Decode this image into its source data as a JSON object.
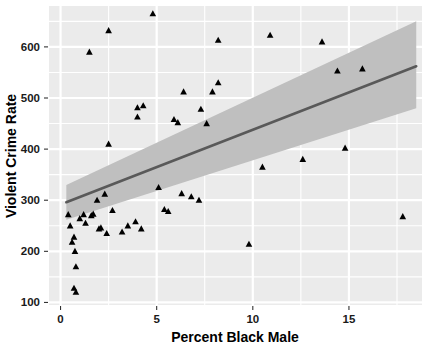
{
  "chart_data": {
    "type": "scatter",
    "title": "",
    "xlabel": "Percent Black Male",
    "ylabel": "Violent Crime Rate",
    "xlim": [
      -0.6,
      18.8
    ],
    "ylim": [
      95,
      680
    ],
    "xticks": [
      0,
      5,
      10,
      15
    ],
    "xtick_labels": [
      "0",
      "5",
      "10",
      "15"
    ],
    "yticks": [
      100,
      200,
      300,
      400,
      500,
      600
    ],
    "ytick_labels": [
      "100",
      "200",
      "300",
      "400",
      "500",
      "600"
    ],
    "grid": true,
    "legend": "none",
    "panel_background": "#EBEBEB",
    "grid_color": "#FFFFFF",
    "point_color": "#000000",
    "point_shape": "triangle",
    "line_color": "#595959",
    "band_color": "#BFBFBF",
    "fit": {
      "type": "linear",
      "intercept": 292,
      "slope": 14.6,
      "x_start": 0.3,
      "x_end": 18.5,
      "y_start": 296,
      "y_end": 562,
      "band_lower_start": 262,
      "band_upper_start": 330,
      "band_lower_end": 480,
      "band_upper_end": 650
    },
    "points": [
      {
        "x": 0.4,
        "y": 272
      },
      {
        "x": 0.5,
        "y": 250
      },
      {
        "x": 0.6,
        "y": 218
      },
      {
        "x": 0.7,
        "y": 228
      },
      {
        "x": 0.75,
        "y": 200
      },
      {
        "x": 0.8,
        "y": 170
      },
      {
        "x": 0.7,
        "y": 128
      },
      {
        "x": 0.8,
        "y": 120
      },
      {
        "x": 1.0,
        "y": 264
      },
      {
        "x": 1.2,
        "y": 272
      },
      {
        "x": 1.3,
        "y": 255
      },
      {
        "x": 1.5,
        "y": 590
      },
      {
        "x": 1.6,
        "y": 270
      },
      {
        "x": 1.7,
        "y": 273
      },
      {
        "x": 1.9,
        "y": 300
      },
      {
        "x": 2.0,
        "y": 244
      },
      {
        "x": 2.1,
        "y": 246
      },
      {
        "x": 2.3,
        "y": 312
      },
      {
        "x": 2.4,
        "y": 235
      },
      {
        "x": 2.5,
        "y": 632
      },
      {
        "x": 2.5,
        "y": 410
      },
      {
        "x": 2.7,
        "y": 280
      },
      {
        "x": 3.2,
        "y": 238
      },
      {
        "x": 3.5,
        "y": 250
      },
      {
        "x": 3.9,
        "y": 258
      },
      {
        "x": 4.0,
        "y": 481
      },
      {
        "x": 4.0,
        "y": 463
      },
      {
        "x": 4.2,
        "y": 244
      },
      {
        "x": 4.3,
        "y": 485
      },
      {
        "x": 4.8,
        "y": 665
      },
      {
        "x": 5.1,
        "y": 325
      },
      {
        "x": 5.4,
        "y": 282
      },
      {
        "x": 5.6,
        "y": 278
      },
      {
        "x": 5.9,
        "y": 458
      },
      {
        "x": 6.1,
        "y": 452
      },
      {
        "x": 6.3,
        "y": 313
      },
      {
        "x": 6.4,
        "y": 512
      },
      {
        "x": 6.8,
        "y": 307
      },
      {
        "x": 7.2,
        "y": 300
      },
      {
        "x": 7.3,
        "y": 478
      },
      {
        "x": 7.6,
        "y": 450
      },
      {
        "x": 7.9,
        "y": 512
      },
      {
        "x": 8.2,
        "y": 613
      },
      {
        "x": 8.2,
        "y": 530
      },
      {
        "x": 9.8,
        "y": 214
      },
      {
        "x": 10.5,
        "y": 365
      },
      {
        "x": 10.9,
        "y": 623
      },
      {
        "x": 12.6,
        "y": 380
      },
      {
        "x": 13.6,
        "y": 610
      },
      {
        "x": 14.4,
        "y": 553
      },
      {
        "x": 14.8,
        "y": 402
      },
      {
        "x": 15.7,
        "y": 557
      },
      {
        "x": 17.8,
        "y": 268
      }
    ]
  },
  "axes": {
    "x_title": "Percent Black Male",
    "y_title": "Violent Crime Rate"
  }
}
